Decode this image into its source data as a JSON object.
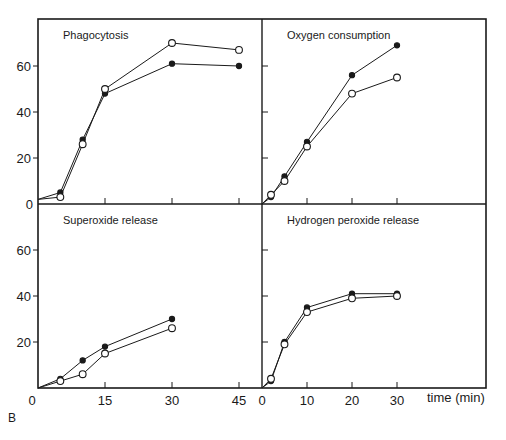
{
  "figure_label": "B",
  "x_axis_label": "time (min)",
  "colors": {
    "ink": "#1a1a1a",
    "background": "#ffffff"
  },
  "chart_data": [
    {
      "type": "line",
      "title": "Phagocytosis",
      "panel": "top-left",
      "xlim": [
        0,
        45
      ],
      "ylim": [
        0,
        75
      ],
      "x_ticks": [
        0,
        15,
        30,
        45
      ],
      "y_ticks": [
        0,
        20,
        40,
        60
      ],
      "series": [
        {
          "name": "filled",
          "marker": "filled-circle",
          "x": [
            0,
            5,
            10,
            15,
            30,
            45
          ],
          "y": [
            2,
            5,
            28,
            48,
            61,
            60
          ]
        },
        {
          "name": "open",
          "marker": "open-circle",
          "x": [
            0,
            5,
            10,
            15,
            30,
            45
          ],
          "y": [
            2,
            3,
            26,
            50,
            70,
            67
          ]
        }
      ]
    },
    {
      "type": "line",
      "title": "Oxygen consumption",
      "panel": "top-right",
      "xlim": [
        0,
        45
      ],
      "ylim": [
        0,
        75
      ],
      "x_ticks": [
        0,
        10,
        20,
        30
      ],
      "y_ticks": [
        0,
        20,
        40,
        60
      ],
      "series": [
        {
          "name": "filled",
          "marker": "filled-circle",
          "x": [
            0,
            2,
            5,
            10,
            20,
            30
          ],
          "y": [
            0,
            3,
            12,
            27,
            56,
            69
          ]
        },
        {
          "name": "open",
          "marker": "open-circle",
          "x": [
            0,
            2,
            5,
            10,
            20,
            30
          ],
          "y": [
            0,
            4,
            10,
            25,
            48,
            55
          ]
        }
      ]
    },
    {
      "type": "line",
      "title": "Superoxide release",
      "panel": "bottom-left",
      "xlim": [
        0,
        45
      ],
      "ylim": [
        0,
        80
      ],
      "x_ticks": [
        0,
        15,
        30,
        45
      ],
      "y_ticks": [
        20,
        40,
        60
      ],
      "series": [
        {
          "name": "filled",
          "marker": "filled-circle",
          "x": [
            0,
            5,
            10,
            15,
            30
          ],
          "y": [
            0,
            4,
            12,
            18,
            30
          ]
        },
        {
          "name": "open",
          "marker": "open-circle",
          "x": [
            0,
            5,
            10,
            15,
            30
          ],
          "y": [
            0,
            3,
            6,
            15,
            26
          ]
        }
      ]
    },
    {
      "type": "line",
      "title": "Hydrogen peroxide release",
      "panel": "bottom-right",
      "xlim": [
        0,
        45
      ],
      "ylim": [
        0,
        80
      ],
      "x_ticks": [
        0,
        10,
        20,
        30
      ],
      "y_ticks": [
        20,
        40,
        60
      ],
      "series": [
        {
          "name": "filled",
          "marker": "filled-circle",
          "x": [
            0,
            2,
            5,
            10,
            20,
            30
          ],
          "y": [
            0,
            3,
            20,
            35,
            41,
            41
          ]
        },
        {
          "name": "open",
          "marker": "open-circle",
          "x": [
            0,
            2,
            5,
            10,
            20,
            30
          ],
          "y": [
            0,
            4,
            19,
            33,
            39,
            40
          ]
        }
      ]
    }
  ]
}
